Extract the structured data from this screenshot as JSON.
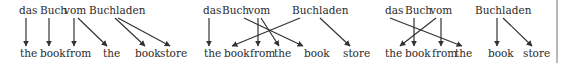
{
  "diagram": {
    "type": "word-alignment",
    "colors": {
      "text": "#2a2a2a",
      "arrow": "#333333",
      "border": "#b8b8b8"
    },
    "panels": [
      {
        "id": "panel-1",
        "source": [
          {
            "text": "das",
            "x": 19
          },
          {
            "text": "Buch",
            "x": 40
          },
          {
            "text": "vom",
            "x": 64
          },
          {
            "text": "Buchladen",
            "x": 89
          }
        ],
        "target": [
          {
            "text": "the",
            "x": 20
          },
          {
            "text": "book",
            "x": 40
          },
          {
            "text": "from",
            "x": 66
          },
          {
            "text": "the",
            "x": 103
          },
          {
            "text": "book",
            "x": 135
          },
          {
            "text": "store",
            "x": 160
          }
        ],
        "alignments": [
          {
            "from": 0,
            "to": 0,
            "x1": 26,
            "x2": 26
          },
          {
            "from": 1,
            "to": 1,
            "x1": 49,
            "x2": 49
          },
          {
            "from": 2,
            "to": 2,
            "x1": 74,
            "x2": 74
          },
          {
            "from": 2,
            "to": 3,
            "x1": 78,
            "x2": 107
          },
          {
            "from": 3,
            "to": 4,
            "x1": 115,
            "x2": 145
          },
          {
            "from": 3,
            "to": 5,
            "x1": 118,
            "x2": 170
          }
        ]
      },
      {
        "id": "panel-2",
        "source": [
          {
            "text": "das",
            "x": 203
          },
          {
            "text": "Buch",
            "x": 222
          },
          {
            "text": "vom",
            "x": 248
          },
          {
            "text": "Buchladen",
            "x": 292
          }
        ],
        "target": [
          {
            "text": "the",
            "x": 204
          },
          {
            "text": "book",
            "x": 224
          },
          {
            "text": "from",
            "x": 250
          },
          {
            "text": "the",
            "x": 274
          },
          {
            "text": "book",
            "x": 304
          },
          {
            "text": "store",
            "x": 343
          }
        ],
        "alignments": [
          {
            "from": 0,
            "to": 0,
            "x1": 209,
            "x2": 209
          },
          {
            "from": 1,
            "to": 4,
            "x1": 244,
            "x2": 303
          },
          {
            "from": 2,
            "to": 2,
            "x1": 258,
            "x2": 258
          },
          {
            "from": 2,
            "to": 3,
            "x1": 261,
            "x2": 279
          },
          {
            "from": 3,
            "to": 1,
            "x1": 300,
            "x2": 232
          },
          {
            "from": 3,
            "to": 5,
            "x1": 320,
            "x2": 350
          }
        ]
      },
      {
        "id": "panel-3",
        "source": [
          {
            "text": "das",
            "x": 385
          },
          {
            "text": "Buch",
            "x": 405
          },
          {
            "text": "vom",
            "x": 430
          },
          {
            "text": "Buchladen",
            "x": 475
          }
        ],
        "target": [
          {
            "text": "the",
            "x": 385
          },
          {
            "text": "book",
            "x": 405
          },
          {
            "text": "from",
            "x": 432
          },
          {
            "text": "the",
            "x": 455
          },
          {
            "text": "book",
            "x": 488
          },
          {
            "text": "store",
            "x": 523
          }
        ],
        "alignments": [
          {
            "from": 0,
            "to": 3,
            "x1": 390,
            "x2": 462
          },
          {
            "from": 1,
            "to": 1,
            "x1": 414,
            "x2": 414
          },
          {
            "from": 2,
            "to": 0,
            "x1": 436,
            "x2": 400
          },
          {
            "from": 2,
            "to": 2,
            "x1": 441,
            "x2": 441
          },
          {
            "from": 3,
            "to": 4,
            "x1": 497,
            "x2": 497
          },
          {
            "from": 3,
            "to": 5,
            "x1": 503,
            "x2": 532
          }
        ]
      }
    ]
  }
}
